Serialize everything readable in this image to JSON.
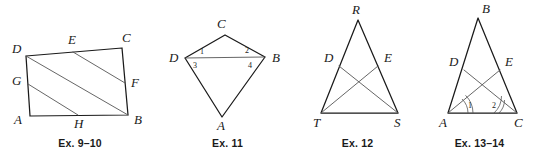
{
  "page": {
    "background_color": "#ffffff",
    "ink_color": "#1a1a1a",
    "inner_line_color": "#555555"
  },
  "figures": [
    {
      "id": "ex-9-10",
      "caption": "Ex. 9–10",
      "shape": "quadrilateral",
      "description": "Quadrilateral ABCD with points E on DC, F on CB, G on DA, H on AB and three parallel segments DB, EF, GH",
      "labels": {
        "a": "A",
        "b": "B",
        "c": "C",
        "d": "D",
        "e": "E",
        "f": "F",
        "g": "G",
        "h": "H"
      }
    },
    {
      "id": "ex-11",
      "caption": "Ex. 11",
      "shape": "kite",
      "description": "Kite ACBD (C top, A bottom, D left, B right) with diagonal DB drawn; angles 1 and 2 above DB, angles 3 and 4 below DB",
      "labels": {
        "a": "A",
        "b": "B",
        "c": "C",
        "d": "D"
      },
      "angles": {
        "one": "1",
        "two": "2",
        "three": "3",
        "four": "4"
      }
    },
    {
      "id": "ex-12",
      "caption": "Ex. 12",
      "shape": "triangle",
      "description": "Isosceles triangle RTS with D on RT, E on RS, and crossing cevians DS and ET",
      "labels": {
        "r": "R",
        "t": "T",
        "s": "S",
        "d": "D",
        "e": "E"
      }
    },
    {
      "id": "ex-13-14",
      "caption": "Ex. 13–14",
      "shape": "triangle",
      "description": "Isosceles triangle ABC with D on AB, E on BC, crossing cevians DC and EA; angle 1 at A and angle 2 at C marked with arcs",
      "labels": {
        "a": "A",
        "b": "B",
        "c": "C",
        "d": "D",
        "e": "E"
      },
      "angles": {
        "one": "1",
        "two": "2"
      }
    }
  ]
}
